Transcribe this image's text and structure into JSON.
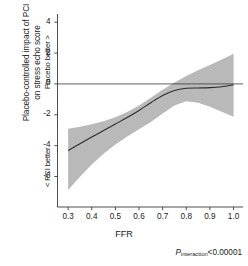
{
  "chart_data": {
    "type": "line",
    "title": "",
    "subtitle": "",
    "xlabel": "FFR",
    "ylabel": "Placebo-controlled impact of PCI\non stress echo score",
    "xlim": [
      0.255,
      1.04
    ],
    "ylim": [
      -7.6,
      4.8
    ],
    "xticks": [
      0.3,
      0.4,
      0.5,
      0.6,
      0.7,
      0.8,
      0.9,
      1.0
    ],
    "xtick_labels": [
      "0.3",
      "0.4",
      "0.5",
      "0.6",
      "0.7",
      "0.8",
      "0.9",
      "1.0"
    ],
    "yticks": [
      4,
      2,
      0,
      -2,
      -4,
      -6
    ],
    "ytick_labels": [
      "4",
      "2",
      "0",
      "-2",
      "-4",
      "-6"
    ],
    "grid": false,
    "legend": false,
    "reference_line_y": 0,
    "x": [
      0.3,
      0.35,
      0.4,
      0.45,
      0.5,
      0.55,
      0.6,
      0.65,
      0.7,
      0.75,
      0.8,
      0.85,
      0.9,
      0.95,
      1.0
    ],
    "series": [
      {
        "name": "Placebo-controlled impact of PCI",
        "values": [
          -4.32,
          -3.88,
          -3.44,
          -3.02,
          -2.6,
          -2.18,
          -1.72,
          -1.22,
          -0.75,
          -0.42,
          -0.28,
          -0.26,
          -0.24,
          -0.18,
          -0.06
        ]
      }
    ],
    "confidence_band": {
      "name": "95% confidence interval",
      "upper": [
        -2.9,
        -2.78,
        -2.62,
        -2.42,
        -2.16,
        -1.82,
        -1.4,
        -0.9,
        -0.38,
        0.1,
        0.52,
        0.88,
        1.22,
        1.58,
        1.95
      ],
      "lower": [
        -6.88,
        -6.02,
        -5.22,
        -4.52,
        -3.92,
        -3.4,
        -2.94,
        -2.46,
        -1.92,
        -1.4,
        -1.12,
        -1.22,
        -1.48,
        -1.8,
        -2.12
      ],
      "color": "#b9b9b9"
    },
    "annotations": [
      {
        "name": "p-interaction",
        "text_prefix": "P",
        "text_subscript": "interaction",
        "text_suffix": "<0.00001"
      },
      {
        "name": "placebo-better-direction",
        "text": "Placebo better >"
      },
      {
        "name": "pci-better-direction",
        "text": "< PCI better"
      }
    ],
    "colors": {
      "line": "#2b2b2b",
      "band": "#b9b9b9",
      "axis": "#3a3a3a",
      "reference_line": "#3a3a3a",
      "background": "#ffffff"
    }
  },
  "axes": {
    "y_title": "Placebo-controlled impact of PCI\non stress echo score",
    "x_title": "FFR"
  },
  "annotations": {
    "placebo_better": "Placebo better >",
    "pci_better": "< PCI better",
    "p_prefix": "P",
    "p_subscript": "interaction",
    "p_suffix": "<0.00001"
  }
}
